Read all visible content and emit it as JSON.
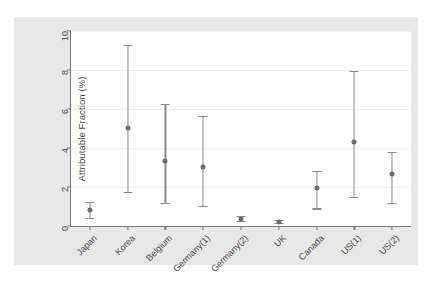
{
  "chart_data": {
    "type": "scatter",
    "title": "",
    "xlabel": "",
    "ylabel": "Attributable Fraction (%)",
    "ylim": [
      0,
      10
    ],
    "yticks": [
      0,
      2,
      4,
      6,
      8,
      10
    ],
    "ytick_labels": [
      "0",
      "2",
      "4",
      "6",
      "8",
      "10"
    ],
    "grid": true,
    "legend": "none",
    "error_bars": "95% confidence interval",
    "categories": [
      "Japan",
      "Korea",
      "Belgium",
      "Germany(1)",
      "Germany(2)",
      "UK",
      "Canada",
      "US(1)",
      "US(2)"
    ],
    "values": [
      0.8,
      5.05,
      3.35,
      3.05,
      0.35,
      0.2,
      1.95,
      4.3,
      2.65
    ],
    "ci_low": [
      0.4,
      1.75,
      1.2,
      1.05,
      0.25,
      0.15,
      0.9,
      1.5,
      1.2
    ],
    "ci_high": [
      1.25,
      9.3,
      6.25,
      5.65,
      0.5,
      0.3,
      2.8,
      7.95,
      3.8
    ],
    "points": [
      {
        "category": "Japan",
        "value": 0.8,
        "ci_low": 0.4,
        "ci_high": 1.25
      },
      {
        "category": "Korea",
        "value": 5.05,
        "ci_low": 1.75,
        "ci_high": 9.3
      },
      {
        "category": "Belgium",
        "value": 3.35,
        "ci_low": 1.2,
        "ci_high": 6.25
      },
      {
        "category": "Germany(1)",
        "value": 3.05,
        "ci_low": 1.05,
        "ci_high": 5.65
      },
      {
        "category": "Germany(2)",
        "value": 0.35,
        "ci_low": 0.25,
        "ci_high": 0.5
      },
      {
        "category": "UK",
        "value": 0.2,
        "ci_low": 0.15,
        "ci_high": 0.3
      },
      {
        "category": "Canada",
        "value": 1.95,
        "ci_low": 0.9,
        "ci_high": 2.8
      },
      {
        "category": "US(1)",
        "value": 4.3,
        "ci_low": 1.5,
        "ci_high": 7.95
      },
      {
        "category": "US(2)",
        "value": 2.65,
        "ci_low": 1.2,
        "ci_high": 3.8
      }
    ],
    "colors": {
      "marker": "#6b6b6b",
      "error_bar": "#8c8c8c",
      "axis": "#7a7a7a",
      "grid": "#f0f0f0",
      "figure_background": "#e8e8e8",
      "plot_background": "#ffffff",
      "tick_text": "#4a4a4a"
    }
  },
  "caption": {
    "text": ""
  }
}
